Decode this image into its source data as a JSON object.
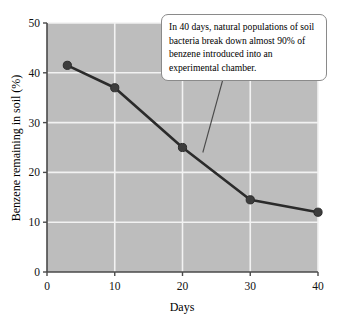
{
  "chart_data": {
    "type": "line",
    "title": "",
    "xlabel": "Days",
    "ylabel": "Benzene remaining in soil (%)",
    "xlim": [
      0,
      40
    ],
    "ylim": [
      0,
      50
    ],
    "grid": true,
    "legend": "none",
    "x": [
      3,
      10,
      20,
      30,
      40
    ],
    "values": [
      41.5,
      37,
      25,
      14.5,
      12
    ],
    "series": [
      {
        "name": "Benzene remaining in soil",
        "x": [
          3,
          10,
          20,
          30,
          40
        ],
        "values": [
          41.5,
          37,
          25,
          14.5,
          12
        ]
      }
    ],
    "xticks": [
      0,
      10,
      20,
      30,
      40
    ],
    "yticks": [
      0,
      10,
      20,
      30,
      40,
      50
    ],
    "xtick_labels": [
      "0",
      "10",
      "20",
      "30",
      "40"
    ],
    "ytick_labels": [
      "0",
      "10",
      "20",
      "30",
      "40",
      "50"
    ],
    "annotations": [
      {
        "text": "In 40 days, natural populations of soil bacteria break down almost 90% of benzene introduced into an experimental chamber.",
        "points_to_x": 23,
        "points_to_y": 24
      }
    ],
    "colors": {
      "plot_background": "#bdbdbd",
      "gridlines": "#f2f2f2",
      "line": "#2b2b2b",
      "marker": "#3d3d3d",
      "axis": "#4a4a4a",
      "callout_background": "#ffffff",
      "callout_border": "#8a8a8a",
      "page_background": "#ffffff"
    }
  }
}
